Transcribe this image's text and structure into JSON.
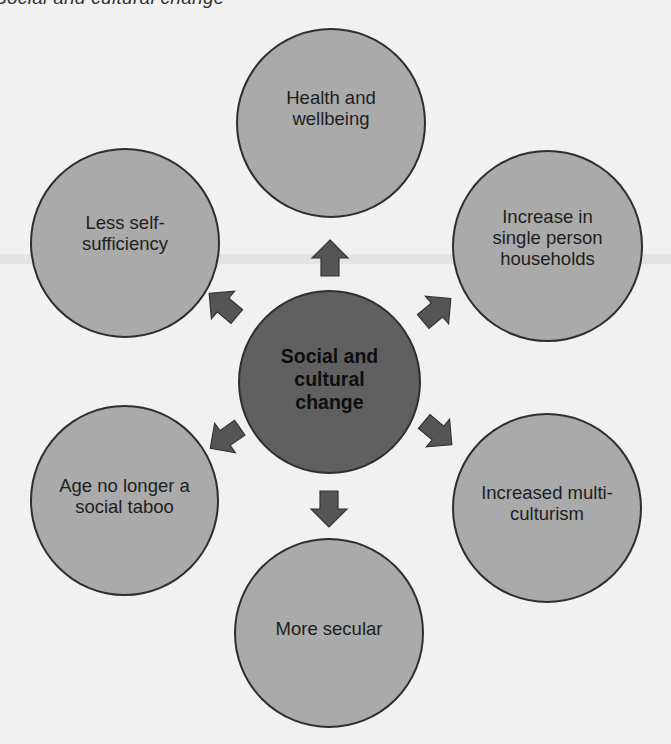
{
  "title": "Social and cultural change",
  "colors": {
    "background": "#f1f1f1",
    "outer_node_fill": "#aaaaaa",
    "center_node_fill": "#606060",
    "arrow_fill": "#555555",
    "outline": "#2e2e2e"
  },
  "center": {
    "label": "Social and\ncultural\nchange"
  },
  "nodes": [
    {
      "id": "top",
      "label": "Health and\nwellbeing"
    },
    {
      "id": "top-right",
      "label": "Increase in\nsingle person\nhouseholds"
    },
    {
      "id": "bottom-right",
      "label": "Increased multi-\nculturism"
    },
    {
      "id": "bottom",
      "label": "More secular"
    },
    {
      "id": "bottom-left",
      "label": "Age no longer a\nsocial taboo"
    },
    {
      "id": "top-left",
      "label": "Less self-\nsufficiency"
    }
  ],
  "arrows": [
    {
      "direction": "up",
      "points_to": "top"
    },
    {
      "direction": "up-right",
      "points_to": "top-right"
    },
    {
      "direction": "down-right",
      "points_to": "bottom-right"
    },
    {
      "direction": "down",
      "points_to": "bottom"
    },
    {
      "direction": "down-left",
      "points_to": "bottom-left"
    },
    {
      "direction": "up-left",
      "points_to": "top-left"
    }
  ]
}
